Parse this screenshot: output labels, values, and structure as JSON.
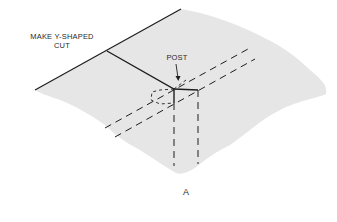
{
  "figure": {
    "caption": "A",
    "labels": {
      "cut_line1": "MAKE Y-SHAPED",
      "cut_line2": "CUT",
      "post": "POST"
    },
    "colors": {
      "surface": "#e6e6e6",
      "ink": "#1e1e1e",
      "background": "#ffffff"
    }
  }
}
